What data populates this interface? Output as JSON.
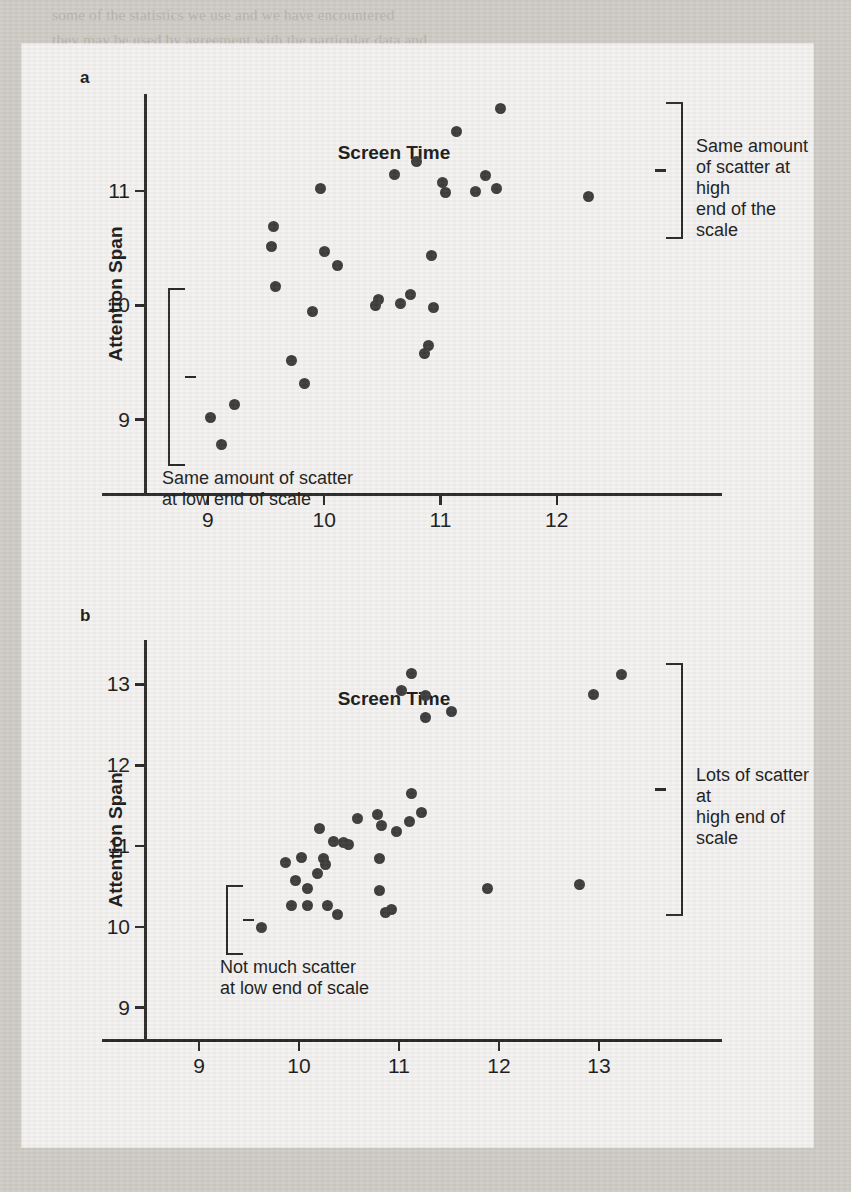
{
  "page": {
    "background_color": "#cfccc6",
    "card_color": "#f3f2ef",
    "ink_color": "#2a2a2a",
    "dot_color": "#3d3d3d"
  },
  "ghost_text": {
    "lines": [
      "some of the statistics we use and we have encountered",
      "they may be used by agreement with the particular data and",
      "but in the population it is flawed.",
      "",
      "of Correlation Analysis  Before we carry out a correlation",
      "or correlation we need to satisfy five assumptions.",
      "these tests:",
      "",
      "1. The sample is randomly selected from the population of",
      "    scores are independent. This means that attention span",
      "    is independent of attention from the population and that",
      "    scores of one participant do not affect her score. For example,",
      "    participants were older and random selection is appropriate",
      "    method. This will reduce the extent to which the results",
      "    of the results from our sample to the population.",
      "2. Both the x and the y variables are measured on interval or ratio",
      "    level of measurement. This assumption underpins the form of",
      "    the assumption that we have encountered in previous hypothesis",
      "    tests as well, but it adds to another requirement in a sample.",
      "3. Each variable needs to be normally distributed. Including the",
      "    full data. Variable needs to be normally distributed across each",
      "    value of the other variable. So, for each score that we have",
      "    for screen time, the distribution of scores for attention span",
      "    needs to be normally distributed and vice versa. Although there",
      "    are options to the assumption, this is the value of the correlation",
      "    coefficient that we make for the individual groups, is important",
      "    to remind us of how significantly affect whether or not we can",
      "    observations met assumptions (and that is more reasonable",
      "    than Friedman's Norm, 1984, Nunnally and Bernstein, 1994).",
      "4. The variance in the Y variable is constant across all values of the",
      "    X variable. This assumption is called the homoscedasticity",
      "    assumption and that in many respects is similar to the equality of",
      "    variances assumption that we need to in other hypothesis tests.",
      "    Indeed, the Greek roots of the term homoscedastic are the",
      "    same as the terms 'homogeneity of variance' that we encountered"
    ]
  },
  "figure": {
    "panels": [
      {
        "letter": "a",
        "axes": {
          "x_title": "Screen Time",
          "y_title": "Attention Span",
          "x_ticks": [
            "9",
            "10",
            "11",
            "12"
          ],
          "y_ticks": [
            "11",
            "10",
            "9"
          ],
          "xlim": [
            8.45,
            12.75
          ],
          "ylim": [
            8.35,
            11.85
          ],
          "x_tick_values": [
            9,
            10,
            11,
            12
          ],
          "y_tick_values": [
            11,
            10,
            9
          ]
        },
        "annotations": [
          {
            "name": "high-end-scatter-note",
            "text": "Same amount\nof scatter at high\nend of the scale",
            "bracket_span_y": [
              10.62,
              11.78
            ],
            "bracket_side": "right"
          },
          {
            "name": "low-end-scatter-note",
            "text": "Same amount of scatter\nat low end of scale",
            "bracket_span_y": [
              8.63,
              10.15
            ],
            "bracket_side": "left"
          }
        ],
        "points": [
          {
            "x": 9.02,
            "y": 9.02
          },
          {
            "x": 9.12,
            "y": 8.78
          },
          {
            "x": 9.23,
            "y": 9.13
          },
          {
            "x": 9.56,
            "y": 10.69
          },
          {
            "x": 9.55,
            "y": 10.52
          },
          {
            "x": 9.58,
            "y": 10.17
          },
          {
            "x": 9.72,
            "y": 9.52
          },
          {
            "x": 9.83,
            "y": 9.32
          },
          {
            "x": 9.9,
            "y": 9.95
          },
          {
            "x": 9.97,
            "y": 11.02
          },
          {
            "x": 10.0,
            "y": 10.47
          },
          {
            "x": 10.11,
            "y": 10.35
          },
          {
            "x": 10.44,
            "y": 10.0
          },
          {
            "x": 10.47,
            "y": 10.05
          },
          {
            "x": 10.6,
            "y": 11.15
          },
          {
            "x": 10.66,
            "y": 10.02
          },
          {
            "x": 10.74,
            "y": 10.1
          },
          {
            "x": 10.79,
            "y": 11.26
          },
          {
            "x": 10.92,
            "y": 10.44
          },
          {
            "x": 10.94,
            "y": 9.98
          },
          {
            "x": 10.9,
            "y": 9.65
          },
          {
            "x": 10.86,
            "y": 9.58
          },
          {
            "x": 11.02,
            "y": 11.08
          },
          {
            "x": 11.04,
            "y": 10.99
          },
          {
            "x": 11.14,
            "y": 11.52
          },
          {
            "x": 11.3,
            "y": 11.0
          },
          {
            "x": 11.39,
            "y": 11.14
          },
          {
            "x": 11.48,
            "y": 11.02
          },
          {
            "x": 11.52,
            "y": 11.72
          },
          {
            "x": 12.27,
            "y": 10.95
          }
        ]
      },
      {
        "letter": "b",
        "axes": {
          "x_title": "Screen Time",
          "y_title": "Attention Span",
          "x_ticks": [
            "9",
            "10",
            "11",
            "12",
            "13"
          ],
          "y_ticks": [
            "13",
            "12",
            "11",
            "10",
            "9"
          ],
          "xlim": [
            8.45,
            13.45
          ],
          "ylim": [
            8.6,
            13.55
          ],
          "x_tick_values": [
            9,
            10,
            11,
            12,
            13
          ],
          "y_tick_values": [
            13,
            12,
            11,
            10,
            9
          ]
        },
        "annotations": [
          {
            "name": "high-end-scatter-note",
            "text": "Lots of scatter at\nhigh end of scale",
            "bracket_span_y": [
              10.18,
              13.27
            ],
            "bracket_side": "right"
          },
          {
            "name": "low-end-scatter-note",
            "text": "Not much scatter\nat low end of scale",
            "bracket_span_y": [
              9.7,
              10.52
            ],
            "bracket_side": "left"
          }
        ],
        "points": [
          {
            "x": 9.62,
            "y": 9.99
          },
          {
            "x": 9.92,
            "y": 10.27
          },
          {
            "x": 10.08,
            "y": 10.27
          },
          {
            "x": 10.28,
            "y": 10.27
          },
          {
            "x": 10.38,
            "y": 10.15
          },
          {
            "x": 9.96,
            "y": 10.57
          },
          {
            "x": 10.08,
            "y": 10.48
          },
          {
            "x": 10.18,
            "y": 10.66
          },
          {
            "x": 9.86,
            "y": 10.8
          },
          {
            "x": 10.02,
            "y": 10.86
          },
          {
            "x": 10.24,
            "y": 10.85
          },
          {
            "x": 10.26,
            "y": 10.77
          },
          {
            "x": 10.34,
            "y": 11.06
          },
          {
            "x": 10.44,
            "y": 11.04
          },
          {
            "x": 10.49,
            "y": 11.02
          },
          {
            "x": 10.2,
            "y": 11.22
          },
          {
            "x": 10.58,
            "y": 11.34
          },
          {
            "x": 10.78,
            "y": 11.39
          },
          {
            "x": 10.82,
            "y": 11.26
          },
          {
            "x": 10.8,
            "y": 10.84
          },
          {
            "x": 10.8,
            "y": 10.45
          },
          {
            "x": 10.86,
            "y": 10.18
          },
          {
            "x": 10.92,
            "y": 10.21
          },
          {
            "x": 10.97,
            "y": 11.18
          },
          {
            "x": 11.1,
            "y": 11.3
          },
          {
            "x": 11.12,
            "y": 11.65
          },
          {
            "x": 11.22,
            "y": 11.41
          },
          {
            "x": 11.26,
            "y": 12.86
          },
          {
            "x": 11.02,
            "y": 12.92
          },
          {
            "x": 11.12,
            "y": 13.13
          },
          {
            "x": 11.26,
            "y": 12.59
          },
          {
            "x": 11.52,
            "y": 12.66
          },
          {
            "x": 11.88,
            "y": 10.48
          },
          {
            "x": 12.8,
            "y": 10.52
          },
          {
            "x": 13.22,
            "y": 13.12
          },
          {
            "x": 12.94,
            "y": 12.88
          }
        ]
      }
    ]
  }
}
